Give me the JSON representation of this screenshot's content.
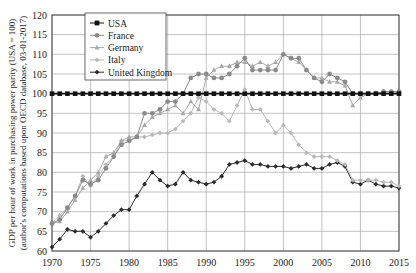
{
  "chart_data": {
    "type": "line",
    "title": "",
    "xlabel": "",
    "ylabel": "GDP per hour of work in purchasing power parity (USA = 100)",
    "ylabel2": "(author's computations based upon OECD database, 03-01-2017)",
    "xlim": [
      1970,
      2015
    ],
    "ylim": [
      60,
      120
    ],
    "x_ticks": [
      1970,
      1975,
      1980,
      1985,
      1990,
      1995,
      2000,
      2005,
      2010,
      2015
    ],
    "y_ticks": [
      60,
      65,
      70,
      75,
      80,
      85,
      90,
      95,
      100,
      105,
      110,
      115,
      120
    ],
    "grid": true,
    "legend_position": "upper-left",
    "x": [
      1970,
      1971,
      1972,
      1973,
      1974,
      1975,
      1976,
      1977,
      1978,
      1979,
      1980,
      1981,
      1982,
      1983,
      1984,
      1985,
      1986,
      1987,
      1988,
      1989,
      1990,
      1991,
      1992,
      1993,
      1994,
      1995,
      1996,
      1997,
      1998,
      1999,
      2000,
      2001,
      2002,
      2003,
      2004,
      2005,
      2006,
      2007,
      2008,
      2009,
      2010,
      2011,
      2012,
      2013,
      2014,
      2015
    ],
    "series": [
      {
        "name": "USA",
        "color": "#111111",
        "marker": "square",
        "values": [
          100,
          100,
          100,
          100,
          100,
          100,
          100,
          100,
          100,
          100,
          100,
          100,
          100,
          100,
          100,
          100,
          100,
          100,
          100,
          100,
          100,
          100,
          100,
          100,
          100,
          100,
          100,
          100,
          100,
          100,
          100,
          100,
          100,
          100,
          100,
          100,
          100,
          100,
          100,
          100,
          100,
          100,
          100,
          100,
          100,
          100
        ]
      },
      {
        "name": "France",
        "color": "#8a8a8a",
        "marker": "circle",
        "values": [
          67,
          68,
          71,
          74,
          78,
          77,
          78,
          81,
          84,
          87,
          88,
          89,
          95,
          95,
          96,
          98,
          98,
          100,
          104,
          105,
          105,
          104,
          104,
          105,
          107,
          109,
          106,
          106,
          106,
          106,
          110,
          109,
          109,
          106,
          104,
          103,
          105,
          104,
          103,
          100,
          100,
          100,
          100,
          100.5,
          100.5,
          100.5
        ]
      },
      {
        "name": "Germany",
        "color": "#a8a8a8",
        "marker": "triangle",
        "values": [
          67,
          67.5,
          70,
          73,
          76,
          78,
          80,
          84,
          85,
          88,
          89,
          89,
          92,
          94,
          95,
          96,
          97,
          95,
          98,
          96,
          104,
          106,
          107,
          107,
          108,
          108,
          107,
          108,
          107,
          108,
          110,
          109,
          108,
          106,
          104,
          104,
          103,
          103,
          102,
          97,
          99,
          100,
          100,
          100.5,
          100.5,
          100.5
        ]
      },
      {
        "name": "Italy",
        "color": "#b8b8b8",
        "marker": "diamond",
        "values": [
          67,
          69,
          71,
          74,
          79,
          76.5,
          79,
          82,
          84,
          88,
          88,
          89,
          89,
          89.5,
          90,
          90,
          91,
          93,
          95,
          99,
          98,
          96,
          95,
          93,
          97,
          101,
          96,
          96,
          93,
          90,
          92,
          90,
          87,
          85,
          84,
          84,
          84,
          83,
          82,
          78,
          78,
          78,
          78,
          77.5,
          77.5,
          76.5
        ]
      },
      {
        "name": "United Kingdom",
        "color": "#2a2a2a",
        "marker": "diamond",
        "values": [
          61,
          63,
          65.5,
          65,
          65,
          63.5,
          65,
          67,
          69,
          70.5,
          70.5,
          74,
          77,
          80,
          78,
          76.5,
          77,
          80,
          78,
          77.5,
          77,
          77.5,
          79,
          82,
          82.5,
          83,
          82,
          82,
          81.5,
          81.5,
          81.5,
          81,
          81.5,
          82,
          81,
          81,
          82,
          82.5,
          81.5,
          77.5,
          77,
          78,
          77,
          76.5,
          76.5,
          76
        ]
      }
    ]
  }
}
